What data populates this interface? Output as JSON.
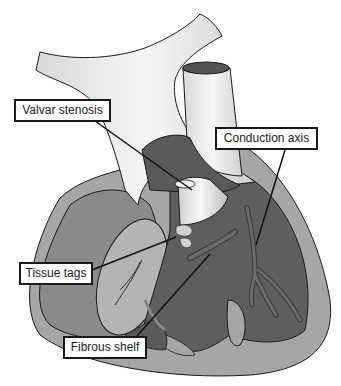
{
  "figure": {
    "labels": [
      {
        "id": "valvar-stenosis",
        "text": "Valvar stenosis"
      },
      {
        "id": "conduction-axis",
        "text": "Conduction axis"
      },
      {
        "id": "tissue-tags",
        "text": "Tissue tags"
      },
      {
        "id": "fibrous-shelf",
        "text": "Fibrous shelf"
      }
    ]
  },
  "colors": {
    "background": "#ffffff",
    "vessel_light": "#e8e8e8",
    "outer_wall": "#a6a6a6",
    "chamber_dark": "#5c5c5c",
    "chamber_mid": "#7a7a7a",
    "atrium_light": "#b4b4b4",
    "outline": "#1a1a1a"
  }
}
